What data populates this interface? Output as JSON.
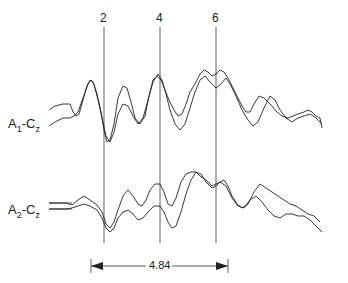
{
  "figure": {
    "markers": [
      {
        "label": "2",
        "x": 104
      },
      {
        "label": "4",
        "x": 160
      },
      {
        "label": "6",
        "x": 216
      }
    ],
    "channels": [
      {
        "label": "A1-Cz",
        "label_main": "A",
        "label_sub": "1",
        "label_rest": "-C",
        "label_sub2": "z"
      },
      {
        "label": "A2-Cz",
        "label_main": "A",
        "label_sub": "2",
        "label_rest": "-C",
        "label_sub2": "z"
      }
    ],
    "measurement": {
      "label": "4.84",
      "x_start": 91,
      "x_end": 228
    }
  },
  "colors": {
    "ink": "#2a2a2a",
    "background": "#ffffff"
  }
}
